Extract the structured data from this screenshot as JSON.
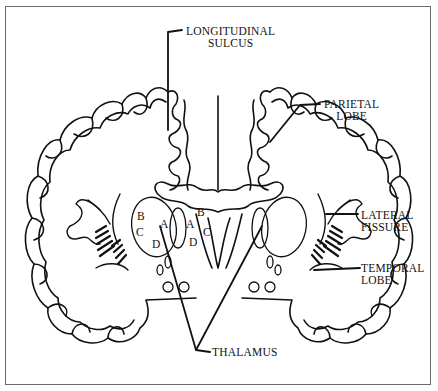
{
  "figure": {
    "colors": {
      "ink": "#111111",
      "frame": "#6b6b6b",
      "background": "#ffffff"
    }
  },
  "labels": {
    "longitudinal_sulcus": {
      "line1": "LONGITUDINAL",
      "line2": "SULCUS"
    },
    "parietal_lobe": {
      "line1": "PARIETAL",
      "line2": "LOBE"
    },
    "lateral_fissure": {
      "line1": "LATERAL",
      "line2": "FISSURE"
    },
    "temporal_lobe": {
      "line1": "TEMPORAL",
      "line2": "LOBE"
    },
    "thalamus": {
      "line1": "THALAMUS"
    }
  },
  "nucleus_letters": {
    "left": {
      "a": "A",
      "b": "B",
      "c": "C",
      "d": "D"
    },
    "right": {
      "a": "A",
      "b": "B",
      "c": "C",
      "d": "D"
    }
  }
}
